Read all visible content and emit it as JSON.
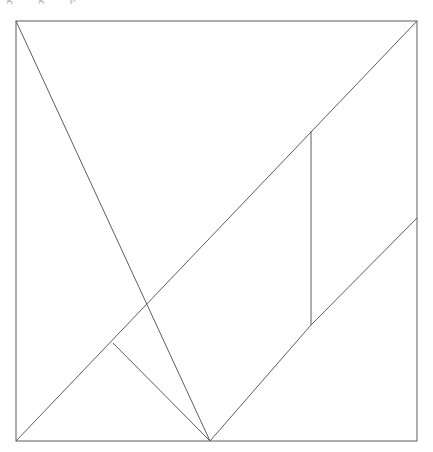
{
  "page": {
    "background_color": "#ffffff",
    "width": 433,
    "height": 452,
    "clipped_header_text": "g g p"
  },
  "figure": {
    "name": "tangram-square",
    "stroke_color": "#5d5d5d",
    "fill_color": "none",
    "stroke_width": 1,
    "outer_square": {
      "name": "outer-square-border",
      "top_left": [
        16,
        21
      ],
      "top_right": [
        417,
        21
      ],
      "bottom_right": [
        417,
        441
      ],
      "bottom_left": [
        16,
        441
      ]
    },
    "vertices": {
      "A_top_left": [
        16,
        21
      ],
      "B_top_right": [
        417,
        21
      ],
      "C_bottom_right": [
        417,
        441
      ],
      "D_bottom_left": [
        16,
        441
      ],
      "E_center": [
        216,
        232
      ],
      "F_bottom_mid": [
        210,
        441
      ],
      "G_right_edge_mid": [
        417,
        218
      ],
      "H_vert_top": [
        311,
        131
      ],
      "I_vert_bottom": [
        311,
        325
      ],
      "J_diamond_left": [
        113,
        343
      ]
    },
    "cut_lines": [
      {
        "name": "main-diagonal-tl-to-bottom-mid",
        "from": [
          16,
          21
        ],
        "to": [
          210,
          441
        ],
        "note": "long diagonal from top-left corner down to bottom edge midpoint"
      },
      {
        "name": "anti-diagonal-bl-to-tr",
        "from": [
          16,
          441
        ],
        "to": [
          417,
          21
        ],
        "note": "long diagonal from bottom-left corner to top-right corner"
      },
      {
        "name": "vertical-cut",
        "from": [
          311,
          131
        ],
        "to": [
          311,
          325
        ],
        "note": "vertical segment on the right half"
      },
      {
        "name": "diamond-upper-right-edge",
        "from": [
          216,
          232
        ],
        "to": [
          311,
          325
        ],
        "note": "shared with anti-diagonal direction"
      },
      {
        "name": "diamond-lower-right-edge",
        "from": [
          311,
          325
        ],
        "to": [
          210,
          441
        ]
      },
      {
        "name": "diamond-lower-left-edge",
        "from": [
          210,
          441
        ],
        "to": [
          113,
          343
        ]
      },
      {
        "name": "diagonal-to-right-edge",
        "from": [
          311,
          325
        ],
        "to": [
          417,
          218
        ]
      }
    ],
    "pieces": [
      {
        "name": "large-triangle-upper-left",
        "points": "16,21 216,232 16,441"
      },
      {
        "name": "large-triangle-upper-right",
        "points": "16,21 417,21 216,232"
      },
      {
        "name": "medium-triangle-lower-left",
        "points": "16,441 113,343 210,441"
      },
      {
        "name": "square-center",
        "points": "216,232 311,325 210,441 113,343"
      },
      {
        "name": "small-triangle-right",
        "points": "311,131 311,325 417,218"
      },
      {
        "name": "triangle-bottom-right",
        "points": "210,441 311,325 417,218 417,441"
      }
    ]
  }
}
